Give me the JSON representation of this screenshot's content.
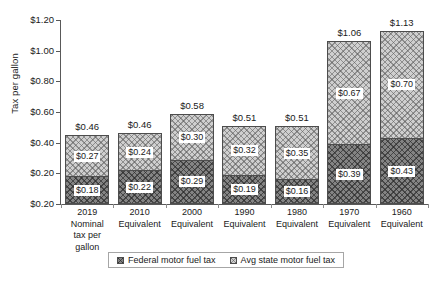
{
  "chart_data": {
    "type": "bar",
    "subtype": "stacked-bar",
    "title": "",
    "xlabel": "",
    "ylabel": "Tax per gallon",
    "ylim": [
      0,
      1.2
    ],
    "ytick_labels": [
      "$1.20",
      "$1.00",
      "$0.80",
      "$0.60",
      "$0.40",
      "$0.20",
      "$0.20"
    ],
    "ytick_values": [
      1.2,
      1.0,
      0.8,
      0.6,
      0.4,
      0.2,
      0.0
    ],
    "grid": false,
    "legend_position": "bottom",
    "categories": [
      "2019 Nominal\ntax per gallon",
      "2010\nEquivalent",
      "2000\nEquivalent",
      "1990\nEquivalent",
      "1980\nEquivalent",
      "1970\nEquivalent",
      "1960\nEquivalent"
    ],
    "series": [
      {
        "name": "Federal motor fuel tax",
        "values": [
          0.18,
          0.22,
          0.29,
          0.19,
          0.16,
          0.39,
          0.43
        ],
        "labels": [
          "$0.18",
          "$0.22",
          "$0.29",
          "$0.19",
          "$0.16",
          "$0.39",
          "$0.43"
        ],
        "color": "#848484",
        "pattern": "dark-crosshatch"
      },
      {
        "name": "Avg state motor fuel tax",
        "values": [
          0.27,
          0.24,
          0.3,
          0.32,
          0.35,
          0.67,
          0.7
        ],
        "labels": [
          "$0.27",
          "$0.24",
          "$0.30",
          "$0.32",
          "$0.35",
          "$0.67",
          "$0.70"
        ],
        "color": "#cfcfcf",
        "pattern": "light-crosshatch"
      }
    ],
    "totals": [
      0.46,
      0.46,
      0.58,
      0.51,
      0.51,
      1.06,
      1.13
    ],
    "total_labels": [
      "$0.46",
      "$0.46",
      "$0.58",
      "$0.51",
      "$0.51",
      "$1.06",
      "$1.13"
    ]
  },
  "legend": {
    "items": [
      {
        "label": "Federal motor fuel tax",
        "swatch": "federal-swatch-icon"
      },
      {
        "label": "Avg state motor fuel tax",
        "swatch": "state-swatch-icon"
      }
    ]
  }
}
